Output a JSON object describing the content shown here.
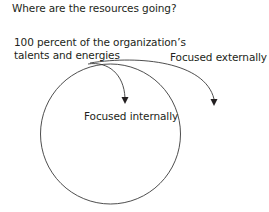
{
  "title": "Where are the resources going?",
  "labels": {
    "total_line1": "100 percent of the organization’s",
    "total_line2": "talents and energies",
    "external": "Focused externally",
    "internal": "Focused internally"
  },
  "colors": {
    "stroke": "#3a3a3a",
    "text": "#231f20",
    "background": "#ffffff"
  }
}
